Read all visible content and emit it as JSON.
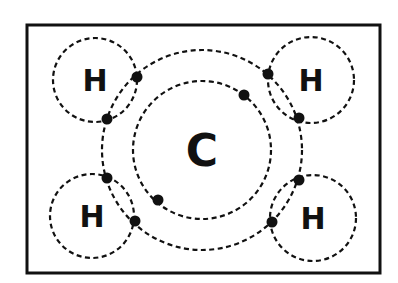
{
  "diagram": {
    "frame": {
      "x": 27,
      "y": 25,
      "width": 353,
      "height": 248
    },
    "colors": {
      "stroke": "#111111",
      "background": "#ffffff"
    },
    "carbon": {
      "label": "C",
      "center": [
        202,
        150
      ],
      "inner_shell_radius": 69,
      "outer_shell_radius": 100
    },
    "hydrogens": [
      {
        "id": "top-left",
        "label": "H",
        "center": [
          95,
          80
        ],
        "radius": 42
      },
      {
        "id": "top-right",
        "label": "H",
        "center": [
          311,
          80
        ],
        "radius": 43
      },
      {
        "id": "bottom-left",
        "label": "H",
        "center": [
          92,
          216
        ],
        "radius": 42
      },
      {
        "id": "bottom-right",
        "label": "H",
        "center": [
          313,
          218
        ],
        "radius": 43
      }
    ],
    "electrons": [
      {
        "shell": "carbon-inner",
        "pos": [
          244,
          95
        ]
      },
      {
        "shell": "carbon-inner",
        "pos": [
          158,
          200
        ]
      },
      {
        "shell": "shared-top-left",
        "pos": [
          137,
          77
        ]
      },
      {
        "shell": "shared-top-left",
        "pos": [
          107,
          119
        ]
      },
      {
        "shell": "shared-top-right",
        "pos": [
          268,
          74
        ]
      },
      {
        "shell": "shared-top-right",
        "pos": [
          299,
          118
        ]
      },
      {
        "shell": "shared-bottom-left",
        "pos": [
          107,
          178
        ]
      },
      {
        "shell": "shared-bottom-left",
        "pos": [
          135,
          221
        ]
      },
      {
        "shell": "shared-bottom-right",
        "pos": [
          299,
          180
        ]
      },
      {
        "shell": "shared-bottom-right",
        "pos": [
          272,
          222
        ]
      }
    ]
  }
}
